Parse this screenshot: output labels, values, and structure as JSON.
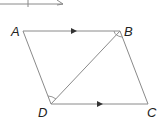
{
  "diagram": {
    "type": "parallelogram",
    "colors": {
      "line": "#8a8a8a",
      "label": "#222222",
      "arrow": "#333333"
    },
    "vertices": [
      {
        "name": "A",
        "x": 23,
        "y": 31,
        "label_x": 11,
        "label_y": 36
      },
      {
        "name": "B",
        "x": 120,
        "y": 31,
        "label_x": 124,
        "label_y": 36
      },
      {
        "name": "C",
        "x": 148,
        "y": 104,
        "label_x": 147,
        "label_y": 117
      },
      {
        "name": "D",
        "x": 51,
        "y": 104,
        "label_x": 38,
        "label_y": 117
      }
    ],
    "labels": {
      "A": "A",
      "B": "B",
      "C": "C",
      "D": "D"
    },
    "segments": [
      "AB",
      "BC",
      "CD",
      "DA",
      "DB"
    ],
    "parallel_markers": [
      "AB",
      "DC"
    ],
    "angle_marks": [
      "ABD",
      "BDC"
    ],
    "partial_top_figure": "cut-off shape at top edge"
  }
}
